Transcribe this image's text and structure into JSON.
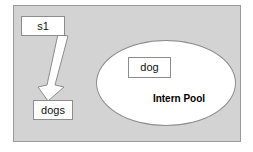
{
  "diagram": {
    "type": "string-interning-diagram",
    "background_color": "#ffffff",
    "region": {
      "name": "memory-region",
      "fill_color": "#d3d3d3",
      "border_color": "#9a9a9a"
    },
    "boxes": [
      {
        "id": "s1",
        "label": "s1",
        "role": "variable-reference",
        "fill_color": "#ffffff",
        "border_color": "#8c8c8c"
      },
      {
        "id": "dogs",
        "label": "dogs",
        "role": "string-object",
        "fill_color": "#ffffff",
        "border_color": "#8c8c8c"
      },
      {
        "id": "dog",
        "label": "dog",
        "role": "interned-string-object",
        "fill_color": "#ffffff",
        "border_color": "#8c8c8c"
      }
    ],
    "pool": {
      "label": "Intern Pool",
      "shape": "ellipse",
      "fill_color": "#ffffff",
      "border_color": "#8c8c8c",
      "label_color": "#000000"
    },
    "arrow": {
      "name": "reference-arrow",
      "from": "s1",
      "to": "dogs",
      "style": "block-arrow",
      "fill_color": "#ffffff",
      "border_color": "#8c8c8c",
      "direction": "down-left"
    }
  }
}
